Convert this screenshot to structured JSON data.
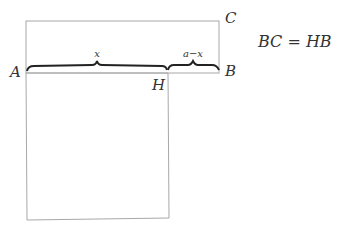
{
  "diagram": {
    "points": {
      "A": "A",
      "B": "B",
      "C": "C",
      "H": "H"
    },
    "braces": {
      "left_label": "x",
      "right_label": "a−x"
    },
    "equation": "BC = HB",
    "colors": {
      "line": "#a8a8a8",
      "brace": "#222222",
      "text": "#333333"
    }
  }
}
